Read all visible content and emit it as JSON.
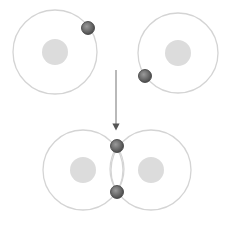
{
  "diagram": {
    "colors": {
      "orbit": "#d4d4d4",
      "nucleus": "#dcdcdc",
      "electron_fill": "#6e6e6e",
      "electron_stroke": "#3a3a3a",
      "arrow": "#8a8a8a"
    },
    "atoms_before": [
      {
        "name": "left-atom",
        "cx": 55,
        "cy": 52,
        "orbit_r": 42,
        "nucleus_r": 13,
        "electron": {
          "cx": 88,
          "cy": 28
        }
      },
      {
        "name": "right-atom",
        "cx": 178,
        "cy": 53,
        "orbit_r": 40,
        "nucleus_r": 13,
        "electron": {
          "cx": 145,
          "cy": 76
        }
      }
    ],
    "arrow": {
      "x": 116,
      "y1": 70,
      "y2": 130
    },
    "molecule_after": {
      "atoms": [
        {
          "name": "left-atom",
          "cx": 83,
          "cy": 170,
          "orbit_r": 40,
          "nucleus_r": 13
        },
        {
          "name": "right-atom",
          "cx": 151,
          "cy": 170,
          "orbit_r": 40,
          "nucleus_r": 13
        }
      ],
      "shared_electrons": [
        {
          "cx": 117,
          "cy": 146
        },
        {
          "cx": 117,
          "cy": 192
        }
      ]
    }
  }
}
